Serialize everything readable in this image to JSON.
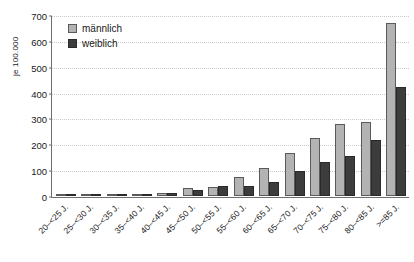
{
  "chart_data": {
    "type": "bar",
    "title": "",
    "subtitle": "",
    "xlabel": "",
    "ylabel": "je 100.000",
    "ylim": [
      0,
      700
    ],
    "ytick_step": 100,
    "yticks": [
      0,
      100,
      200,
      300,
      400,
      500,
      600,
      700
    ],
    "ytick_labels": [
      "0",
      "100",
      "200",
      "300",
      "400",
      "500",
      "600",
      "700"
    ],
    "grid": true,
    "legend_position": "top-left",
    "categories": [
      "20–<25 J.",
      "25–<30 J.",
      "30–<35 J.",
      "35–<40 J.",
      "40–<45 J.",
      "45–<50 J.",
      "50–<55 J.",
      "55–<60 J.",
      "60–<65 J.",
      "65–<70 J.",
      "70–<75 J.",
      "75–<80 J.",
      "80–<85 J.",
      ">=85 J."
    ],
    "series": [
      {
        "name": "männlich",
        "color": "#b3b3b3",
        "border_color": "#5a5a5a",
        "values": [
          3,
          1,
          3,
          8,
          12,
          30,
          35,
          75,
          110,
          165,
          225,
          280,
          285,
          670
        ]
      },
      {
        "name": "weiblich",
        "color": "#3c3c3c",
        "border_color": "#2a2a2a",
        "values": [
          0,
          0,
          1,
          4,
          10,
          22,
          38,
          40,
          55,
          95,
          130,
          155,
          215,
          420
        ]
      }
    ]
  },
  "legend": {
    "items": [
      {
        "label": "männlich",
        "swatch": "legend-swatch-male"
      },
      {
        "label": "weiblich",
        "swatch": "legend-swatch-female"
      }
    ]
  }
}
